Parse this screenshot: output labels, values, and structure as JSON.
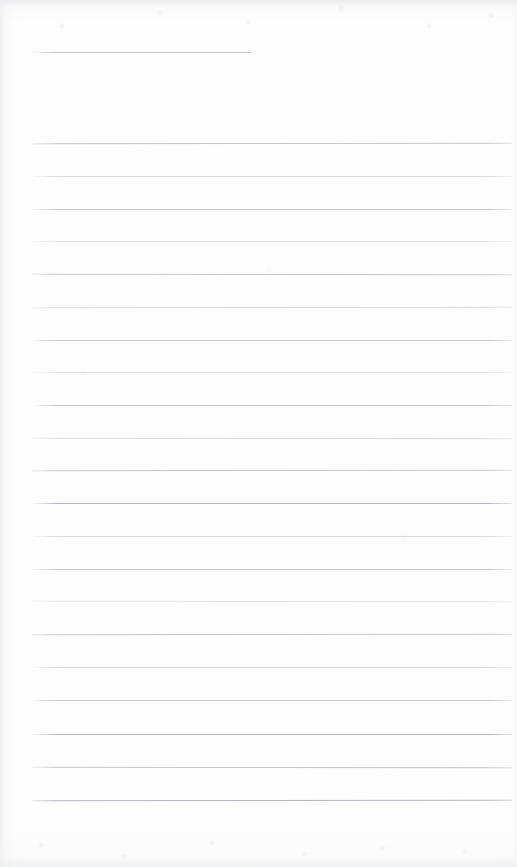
{
  "document": {
    "kind": "scanned-lined-notebook-page",
    "content_text": "",
    "page_width": 517,
    "page_height": 867,
    "paper_color": "#fdfdfd",
    "rule_color": "#b9bcc1",
    "edge_shadow_color": "#e9eaec",
    "has_handwriting": false,
    "has_printed_text": false
  },
  "header_rule": {
    "label": "short top rule",
    "x": 32,
    "y": 52,
    "width": 219,
    "end_x": 251
  },
  "ruling": {
    "line_count": 21,
    "first_line_y": 143,
    "last_line_y": 800,
    "spacing": 32.85,
    "left_x": 32,
    "right_x": 512,
    "width": 480,
    "lines": [
      {
        "y": 143,
        "x": 32,
        "width": 480,
        "weight": "normal"
      },
      {
        "y": 176,
        "x": 32,
        "width": 480,
        "weight": "soft"
      },
      {
        "y": 209,
        "x": 32,
        "width": 480,
        "weight": "normal"
      },
      {
        "y": 241,
        "x": 32,
        "width": 480,
        "weight": "softer"
      },
      {
        "y": 274,
        "x": 32,
        "width": 480,
        "weight": "normal"
      },
      {
        "y": 307,
        "x": 32,
        "width": 480,
        "weight": "soft"
      },
      {
        "y": 340,
        "x": 32,
        "width": 480,
        "weight": "normal"
      },
      {
        "y": 372,
        "x": 32,
        "width": 480,
        "weight": "softer"
      },
      {
        "y": 405,
        "x": 32,
        "width": 480,
        "weight": "normal"
      },
      {
        "y": 438,
        "x": 32,
        "width": 480,
        "weight": "soft"
      },
      {
        "y": 470,
        "x": 32,
        "width": 480,
        "weight": "normal"
      },
      {
        "y": 503,
        "x": 32,
        "width": 480,
        "weight": "firm"
      },
      {
        "y": 536,
        "x": 32,
        "width": 480,
        "weight": "soft"
      },
      {
        "y": 569,
        "x": 32,
        "width": 480,
        "weight": "normal"
      },
      {
        "y": 601,
        "x": 32,
        "width": 480,
        "weight": "softer"
      },
      {
        "y": 634,
        "x": 32,
        "width": 480,
        "weight": "normal"
      },
      {
        "y": 667,
        "x": 32,
        "width": 480,
        "weight": "soft"
      },
      {
        "y": 700,
        "x": 32,
        "width": 480,
        "weight": "normal"
      },
      {
        "y": 734,
        "x": 32,
        "width": 480,
        "weight": "firm"
      },
      {
        "y": 767,
        "x": 32,
        "width": 480,
        "weight": "normal"
      },
      {
        "y": 800,
        "x": 32,
        "width": 480,
        "weight": "firm"
      }
    ]
  }
}
